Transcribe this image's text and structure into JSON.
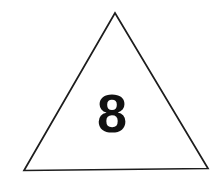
{
  "figure": {
    "background_color": "#ffffff",
    "shape": {
      "name": "triangle",
      "type": "isosceles-triangle",
      "fill": "none",
      "stroke_color": "#1d1d1d",
      "stroke_width": 1.7,
      "points": "115,13 208,168.5 24,170.5",
      "vertices": {
        "apex": {
          "x": 115,
          "y": 13
        },
        "bottom_right": {
          "x": 208,
          "y": 168.5
        },
        "bottom_left": {
          "x": 24,
          "y": 170.5
        }
      }
    },
    "label": {
      "name": "number-eight",
      "text": "8",
      "color": "#111111",
      "font_size_px": 54,
      "font_weight": "bold",
      "center_x": 112,
      "baseline_y": 132
    }
  }
}
